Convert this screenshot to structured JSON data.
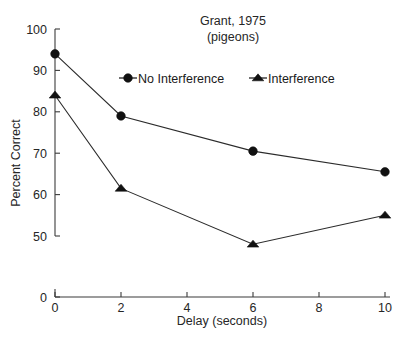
{
  "chart_data": {
    "type": "line",
    "title": "Grant, 1975",
    "subtitle": "(pigeons)",
    "xlabel": "Delay (seconds)",
    "ylabel": "Percent Correct",
    "x": [
      0,
      2,
      6,
      10
    ],
    "xticks": [
      "0",
      "2",
      "4",
      "6",
      "8",
      "10"
    ],
    "xtick_values": [
      0,
      2,
      4,
      6,
      8,
      10
    ],
    "yticks": [
      "0",
      "50",
      "60",
      "70",
      "80",
      "90",
      "100"
    ],
    "ytick_values": [
      0,
      50,
      60,
      70,
      80,
      90,
      100
    ],
    "xlim": [
      0,
      10
    ],
    "ylim": [
      0,
      100
    ],
    "axis_break": true,
    "grid": false,
    "legend_position": "top-center",
    "series": [
      {
        "name": "No Interference",
        "marker": "circle",
        "color": "#111111",
        "values": [
          94,
          79,
          70.5,
          65.5
        ]
      },
      {
        "name": "Interference",
        "marker": "triangle",
        "color": "#111111",
        "values": [
          84,
          61.5,
          48,
          55
        ]
      }
    ]
  },
  "legend": {
    "items": [
      {
        "label": "No Interference",
        "marker": "circle-marker"
      },
      {
        "label": "Interference",
        "marker": "triangle-marker"
      }
    ]
  },
  "colors": {
    "background": "#ffffff",
    "axis": "#3b3b3b",
    "ink": "#111111"
  }
}
